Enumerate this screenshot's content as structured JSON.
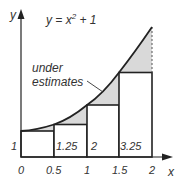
{
  "equation": {
    "base": "y = x",
    "exp": "2",
    "tail": " + 1"
  },
  "annotation": {
    "line1": "under",
    "line2": "estimates"
  },
  "axes": {
    "x_label": "x",
    "y_label": "y",
    "x_ticks": [
      "0",
      "0.5",
      "1",
      "1.5",
      "2"
    ]
  },
  "rectangles": [
    {
      "x_start": 0,
      "x_end": 0.5,
      "height": 1,
      "label": "1"
    },
    {
      "x_start": 0.5,
      "x_end": 1,
      "height": 1.25,
      "label": "1.25"
    },
    {
      "x_start": 1,
      "x_end": 1.5,
      "height": 2,
      "label": "2"
    },
    {
      "x_start": 1.5,
      "x_end": 2,
      "height": 3.25,
      "label": "3.25"
    }
  ],
  "colors": {
    "line": "#222222",
    "shade": "#d9d9d9",
    "text": "#333333"
  }
}
